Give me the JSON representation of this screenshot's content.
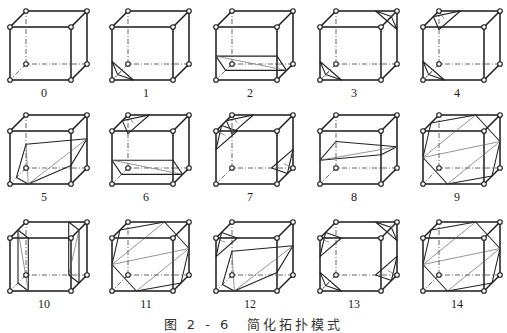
{
  "figure": {
    "caption": "图 2 - 6　简化拓扑模式",
    "grid": {
      "rows": 3,
      "columns": 5
    },
    "cases": [
      {
        "label": "0",
        "pattern": []
      },
      {
        "label": "1",
        "pattern": [
          "t:0"
        ]
      },
      {
        "label": "2",
        "pattern": [
          "q:0,1"
        ]
      },
      {
        "label": "3",
        "pattern": [
          "t:0",
          "t:6"
        ]
      },
      {
        "label": "4",
        "pattern": [
          "t:0",
          "t:7"
        ]
      },
      {
        "label": "5",
        "pattern": [
          "p:1,2,3"
        ]
      },
      {
        "label": "6",
        "pattern": [
          "q:0,1",
          "t:7"
        ]
      },
      {
        "label": "7",
        "pattern": [
          "t:4",
          "t:7",
          "t:2"
        ]
      },
      {
        "label": "8",
        "pattern": [
          "q:0,1,2,3"
        ]
      },
      {
        "label": "9",
        "pattern": [
          "h:0,2,3,7"
        ]
      },
      {
        "label": "10",
        "pattern": [
          "q:0,4",
          "q:2,6"
        ]
      },
      {
        "label": "11",
        "pattern": [
          "h:0,2,6,7"
        ]
      },
      {
        "label": "12",
        "pattern": [
          "p:1,2,3",
          "t:4"
        ]
      },
      {
        "label": "13",
        "pattern": [
          "t:0",
          "t:4",
          "t:6",
          "t:2"
        ]
      },
      {
        "label": "14",
        "pattern": [
          "h:0,1,5,6"
        ]
      }
    ]
  }
}
